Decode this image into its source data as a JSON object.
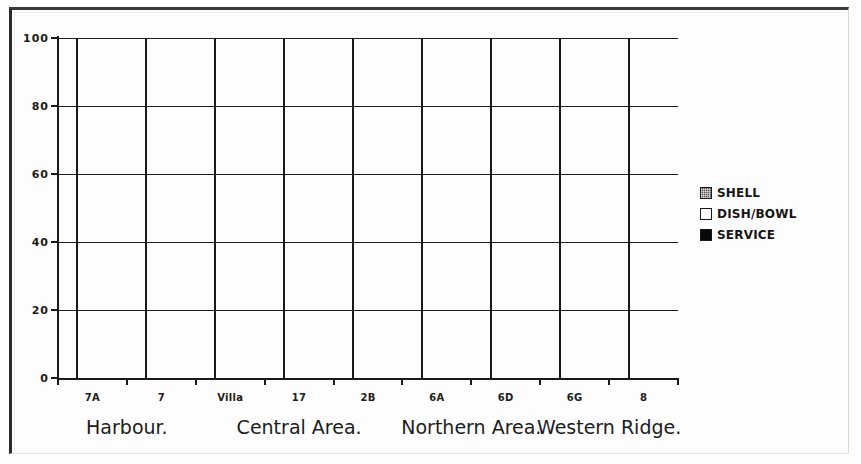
{
  "chart_data": {
    "type": "bar",
    "subtype": "stacked-100-percent",
    "title": "",
    "xlabel": "",
    "ylabel": "",
    "ylim": [
      0,
      100
    ],
    "yticks": [
      0,
      20,
      40,
      60,
      80,
      100
    ],
    "ytick_labels": [
      "0",
      "20",
      "40",
      "60",
      "80",
      "100"
    ],
    "grid": true,
    "grid_axis": "y",
    "legend_position": "right",
    "categories": [
      "7A",
      "7",
      "Villa",
      "17",
      "2B",
      "6A",
      "6D",
      "6G",
      "8"
    ],
    "series": [
      {
        "name": "SERVICE",
        "color": "#080808",
        "values": [
          60,
          42,
          55.5,
          45.5,
          51.5,
          22.5,
          9,
          15,
          0
        ]
      },
      {
        "name": "DISH/BOWL",
        "color": "#ffffff",
        "values": [
          40,
          58,
          44.5,
          54.5,
          48.5,
          76.5,
          91,
          78,
          80
        ]
      },
      {
        "name": "SHELL",
        "color": "#555555",
        "values": [
          0,
          0,
          0,
          0,
          0,
          1,
          0,
          7,
          20
        ]
      }
    ],
    "legend": [
      {
        "label": "SHELL",
        "color": "#555555",
        "swatch": "hatched"
      },
      {
        "label": "DISH/BOWL",
        "color": "#ffffff",
        "swatch": "open"
      },
      {
        "label": "SERVICE",
        "color": "#080808",
        "swatch": "filled"
      }
    ],
    "groups": [
      {
        "label": "Harbour.",
        "categories": [
          "7A",
          "7"
        ]
      },
      {
        "label": "Central Area.",
        "categories": [
          "Villa",
          "17",
          "2B"
        ]
      },
      {
        "label": "Northern Area.",
        "categories": [
          "6A",
          "6D"
        ]
      },
      {
        "label": "Western Ridge.",
        "categories": [
          "6G",
          "8"
        ]
      }
    ]
  }
}
